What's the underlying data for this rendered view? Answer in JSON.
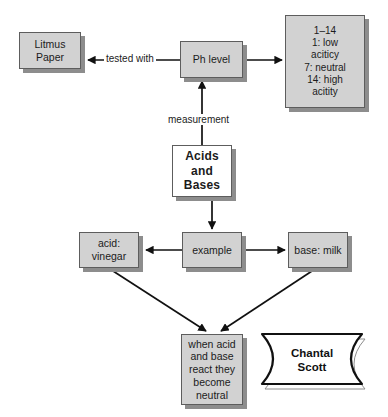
{
  "diagram": {
    "colors": {
      "node_fill": "#d2d2d2",
      "node_fill_alt": "#ffffff",
      "node_border": "#5d5d5d",
      "shadow": "#8d8d8d",
      "background": "#ffffff",
      "text": "#1b1b1b"
    },
    "nodes": {
      "litmus": "Litmus\nPaper",
      "ph_level": "Ph level",
      "scale": "1–14\n1: low\naciticy\n7: neutral\n14: high\nacitity",
      "acids_and_bases": "Acids\nand\nBases",
      "example": "example",
      "acid": "acid:\nvinegar",
      "base": "base: milk",
      "neutral": "when acid\nand base\nreact they\nbecome\nneutral"
    },
    "edge_labels": {
      "tested_with": "tested with",
      "measurement": "measurement"
    },
    "signature": "Chantal\nScott"
  }
}
